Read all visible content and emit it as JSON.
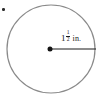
{
  "figure": {
    "kind": "circle-radius-diagram",
    "canvas": {
      "width": 102,
      "height": 97,
      "background": "#ffffff"
    },
    "circle": {
      "center_x": 51,
      "center_y": 49,
      "radius": 44,
      "stroke_color": "#8a8a8a",
      "stroke_width": 1.2,
      "fill": "none"
    },
    "center_point": {
      "x": 50,
      "y": 49,
      "diameter": 5,
      "color": "#141414"
    },
    "radius_segment": {
      "x1": 50,
      "y1": 49,
      "x2": 96,
      "y2": 49,
      "color": "#1b1b1b",
      "stroke_width": 1.1
    },
    "radius_label": {
      "full_text": "1 1/2 in.",
      "whole_number": "1",
      "numerator": "1",
      "denominator": "2",
      "unit": "in.",
      "color": "#1b1b1b"
    },
    "artifact": {
      "name": "corner-speck",
      "x": 2,
      "y": 8,
      "color": "#2a2a2a"
    }
  }
}
